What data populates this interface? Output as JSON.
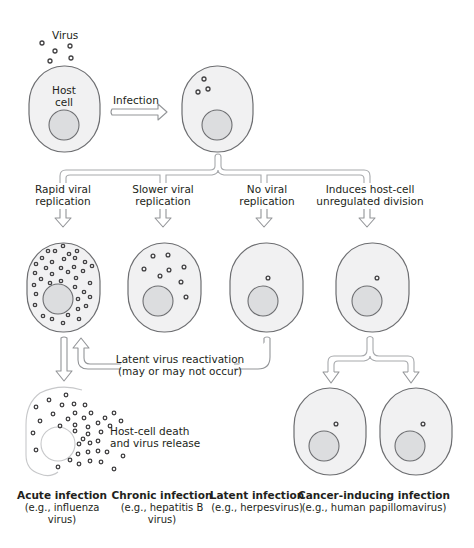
{
  "figure": {
    "stage1": {
      "virus_label": "Virus",
      "host_cell_label_line1": "Host",
      "host_cell_label_line2": "cell",
      "infection_label": "Infection"
    },
    "branches": [
      {
        "id": "rapid",
        "line1": "Rapid viral",
        "line2": "replication"
      },
      {
        "id": "slower",
        "line1": "Slower viral",
        "line2": "replication"
      },
      {
        "id": "none",
        "line1": "No viral",
        "line2": "replication"
      },
      {
        "id": "division",
        "line1": "Induces host-cell",
        "line2": "unregulated division"
      }
    ],
    "reactivation": {
      "line1": "Latent virus reactivation",
      "line2": "(may or may not occur)"
    },
    "death": {
      "line1": "Host-cell death",
      "line2": "and virus release"
    },
    "outcomes": [
      {
        "title": "Acute infection",
        "line1": "(e.g., influenza",
        "line2": "virus)"
      },
      {
        "title": "Chronic infection",
        "line1": "(e.g., hepatitis B",
        "line2": "virus)"
      },
      {
        "title": "Latent infection",
        "line1": "(e.g., herpesvirus)",
        "line2": ""
      },
      {
        "title": "Cancer-inducing infection",
        "line1": "(e.g., human papillomavirus)",
        "line2": ""
      }
    ],
    "colors": {
      "cell_fill": "#f1f1f2",
      "nucleus_fill": "#dcdddf",
      "outline": "#6d6e71",
      "virus": "#414042",
      "arrow_outline": "#939598"
    }
  }
}
